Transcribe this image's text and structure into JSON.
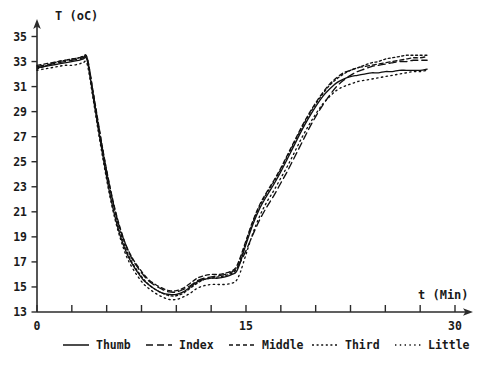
{
  "chart_data": {
    "type": "line",
    "title": "",
    "xlabel": "t (Min)",
    "ylabel": "T (oC)",
    "xlim": [
      0,
      30
    ],
    "ylim": [
      13,
      35
    ],
    "grid": false,
    "legend_position": "bottom",
    "x_ticks": [
      0,
      2.5,
      5,
      7.5,
      10,
      12.5,
      15,
      17.5,
      20,
      22.5,
      25,
      27.5,
      30
    ],
    "x_tick_labels": [
      "0",
      "",
      "",
      "",
      "",
      "",
      "15",
      "",
      "",
      "",
      "",
      "",
      "30"
    ],
    "y_ticks": [
      13,
      15,
      17,
      19,
      21,
      23,
      25,
      27,
      29,
      31,
      33,
      35
    ],
    "y_tick_labels": [
      "13",
      "15",
      "17",
      "19",
      "21",
      "23",
      "25",
      "27",
      "29",
      "31",
      "33",
      "35"
    ],
    "x": [
      0,
      0.5,
      1,
      1.5,
      2,
      2.5,
      3,
      3.3,
      3.6,
      4,
      4.4,
      4.8,
      5.2,
      5.6,
      6,
      6.4,
      6.8,
      7.2,
      7.6,
      8,
      8.5,
      9,
      9.5,
      10,
      10.5,
      11,
      11.5,
      12,
      12.5,
      13,
      13.5,
      14,
      14.3,
      14.6,
      15,
      15.5,
      16,
      16.5,
      17,
      17.5,
      18,
      18.5,
      19,
      19.5,
      20,
      20.5,
      21,
      21.5,
      22,
      22.5,
      23,
      23.5,
      24,
      24.5,
      25,
      25.5,
      26,
      26.5,
      27,
      27.5,
      28
    ],
    "series": [
      {
        "name": "Thumb",
        "style": "solid",
        "values": [
          32.5,
          32.6,
          32.7,
          32.8,
          32.9,
          33.0,
          33.1,
          33.2,
          33.1,
          30.4,
          27.6,
          25.0,
          22.6,
          20.6,
          19.0,
          17.8,
          16.9,
          16.2,
          15.6,
          15.2,
          14.8,
          14.5,
          14.4,
          14.4,
          14.6,
          15.0,
          15.4,
          15.6,
          15.7,
          15.7,
          15.8,
          16.0,
          16.2,
          17.0,
          18.4,
          20.0,
          21.3,
          22.3,
          23.2,
          24.2,
          25.3,
          26.4,
          27.5,
          28.5,
          29.4,
          30.2,
          30.8,
          31.3,
          31.6,
          31.8,
          31.9,
          32.0,
          32.1,
          32.1,
          32.2,
          32.2,
          32.3,
          32.3,
          32.3,
          32.3,
          32.4
        ]
      },
      {
        "name": "Index",
        "style": "dashed",
        "values": [
          32.6,
          32.7,
          32.8,
          32.9,
          33.0,
          33.1,
          33.2,
          33.3,
          33.2,
          30.6,
          27.9,
          25.4,
          23.1,
          21.1,
          19.5,
          18.3,
          17.3,
          16.6,
          16.0,
          15.5,
          15.1,
          14.8,
          14.6,
          14.6,
          14.8,
          15.1,
          15.5,
          15.7,
          15.8,
          15.9,
          16.0,
          16.2,
          16.5,
          17.0,
          17.9,
          19.2,
          20.4,
          21.4,
          22.3,
          23.3,
          24.3,
          25.4,
          26.5,
          27.6,
          28.6,
          29.5,
          30.3,
          31.0,
          31.5,
          31.9,
          32.2,
          32.4,
          32.6,
          32.7,
          32.8,
          32.9,
          33.0,
          33.0,
          33.1,
          33.1,
          33.1
        ]
      },
      {
        "name": "Middle",
        "style": "short-dash",
        "values": [
          32.7,
          32.8,
          32.9,
          33.0,
          33.1,
          33.2,
          33.3,
          33.4,
          33.3,
          30.8,
          28.1,
          25.5,
          23.2,
          21.2,
          19.6,
          18.3,
          17.4,
          16.7,
          16.1,
          15.6,
          15.2,
          14.9,
          14.7,
          14.7,
          14.9,
          15.3,
          15.7,
          15.9,
          16.0,
          16.0,
          16.1,
          16.3,
          16.6,
          17.4,
          18.7,
          20.3,
          21.6,
          22.6,
          23.5,
          24.5,
          25.6,
          26.7,
          27.8,
          28.8,
          29.7,
          30.5,
          31.2,
          31.7,
          32.1,
          32.3,
          32.5,
          32.6,
          32.7,
          32.8,
          32.9,
          33.0,
          33.1,
          33.2,
          33.3,
          33.3,
          33.4
        ]
      },
      {
        "name": "Third",
        "style": "dotted",
        "values": [
          32.4,
          32.6,
          32.8,
          33.0,
          33.1,
          33.2,
          33.3,
          33.4,
          33.3,
          30.7,
          28.0,
          25.4,
          23.0,
          21.0,
          19.3,
          18.0,
          17.0,
          16.3,
          15.7,
          15.2,
          14.8,
          14.5,
          14.3,
          14.3,
          14.5,
          14.9,
          15.3,
          15.6,
          15.7,
          15.8,
          15.9,
          16.1,
          16.4,
          17.2,
          18.6,
          20.2,
          21.5,
          22.5,
          23.4,
          24.4,
          25.5,
          26.6,
          27.7,
          28.7,
          29.6,
          30.4,
          31.1,
          31.6,
          32.0,
          32.3,
          32.5,
          32.7,
          32.9,
          33.0,
          33.2,
          33.3,
          33.4,
          33.5,
          33.5,
          33.5,
          33.5
        ]
      },
      {
        "name": "Little",
        "style": "sparse-dotted",
        "values": [
          32.3,
          32.4,
          32.5,
          32.6,
          32.7,
          32.7,
          32.8,
          32.9,
          32.8,
          30.2,
          27.4,
          24.8,
          22.4,
          20.4,
          18.8,
          17.5,
          16.6,
          15.9,
          15.3,
          14.9,
          14.5,
          14.2,
          14.0,
          14.0,
          14.2,
          14.5,
          14.9,
          15.1,
          15.2,
          15.2,
          15.2,
          15.3,
          15.5,
          16.2,
          17.6,
          19.3,
          20.7,
          21.8,
          22.7,
          23.7,
          24.7,
          25.8,
          26.9,
          27.9,
          28.8,
          29.6,
          30.2,
          30.7,
          31.0,
          31.2,
          31.4,
          31.5,
          31.6,
          31.7,
          31.8,
          31.9,
          32.0,
          32.1,
          32.2,
          32.2,
          32.3
        ]
      }
    ],
    "legend": [
      {
        "label": "Thumb",
        "style": "solid"
      },
      {
        "label": "Index",
        "style": "dashed"
      },
      {
        "label": "Middle",
        "style": "short-dash"
      },
      {
        "label": "Third",
        "style": "dotted"
      },
      {
        "label": "Little",
        "style": "sparse-dotted"
      }
    ]
  }
}
